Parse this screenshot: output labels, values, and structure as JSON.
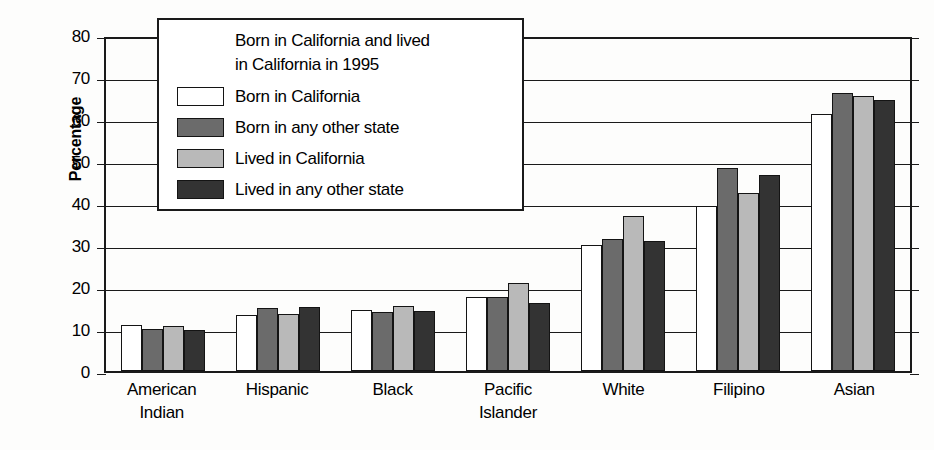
{
  "chart_data": {
    "type": "bar",
    "title": "",
    "xlabel": "",
    "ylabel": "Percentage",
    "ylim": [
      0,
      80
    ],
    "yticks": [
      0,
      10,
      20,
      30,
      40,
      50,
      60,
      70,
      80
    ],
    "grid": true,
    "legend_position": "upper-left-inside",
    "legend_title": [
      "Born in California and lived",
      "in California in 1995"
    ],
    "categories": [
      [
        "American",
        "Indian"
      ],
      [
        "Hispanic",
        ""
      ],
      [
        "Black",
        ""
      ],
      [
        "Pacific",
        "Islander"
      ],
      [
        "White",
        ""
      ],
      [
        "Filipino",
        ""
      ],
      [
        "Asian",
        ""
      ]
    ],
    "category_names": [
      "American Indian",
      "Hispanic",
      "Black",
      "Pacific Islander",
      "White",
      "Filipino",
      "Asian"
    ],
    "series": [
      {
        "name": "Born in California",
        "color": "#ffffff",
        "values": [
          11.0,
          13.4,
          14.5,
          17.6,
          30.0,
          39.3,
          61.3
        ]
      },
      {
        "name": "Born in any other state",
        "color": "#6b6b6b",
        "values": [
          10.1,
          14.9,
          14.1,
          17.7,
          31.4,
          48.4,
          66.2
        ]
      },
      {
        "name": "Lived in California",
        "color": "#b9b9b9",
        "values": [
          10.8,
          13.6,
          15.4,
          21.0,
          36.9,
          42.5,
          65.4
        ]
      },
      {
        "name": "Lived in any other state",
        "color": "#333333",
        "values": [
          9.7,
          15.2,
          14.4,
          16.3,
          31.0,
          46.7,
          64.6
        ]
      }
    ]
  },
  "axis": {
    "y_title": "Percentage",
    "tick_0": "0",
    "tick_10": "10",
    "tick_20": "20",
    "tick_30": "30",
    "tick_40": "40",
    "tick_50": "50",
    "tick_60": "60",
    "tick_70": "70",
    "tick_80": "80"
  },
  "legend": {
    "title_line1": "Born in California and lived",
    "title_line2": "in California in 1995",
    "items": [
      {
        "label": "Born in California",
        "swatch": "white-swatch"
      },
      {
        "label": "Born in any other state",
        "swatch": "dark-gray-swatch"
      },
      {
        "label": "Lived in California",
        "swatch": "light-gray-swatch"
      },
      {
        "label": "Lived in any other state",
        "swatch": "black-swatch"
      }
    ]
  },
  "x_labels": [
    {
      "line1": "American",
      "line2": "Indian"
    },
    {
      "line1": "Hispanic",
      "line2": ""
    },
    {
      "line1": "Black",
      "line2": ""
    },
    {
      "line1": "Pacific",
      "line2": "Islander"
    },
    {
      "line1": "White",
      "line2": ""
    },
    {
      "line1": "Filipino",
      "line2": ""
    },
    {
      "line1": "Asian",
      "line2": ""
    }
  ]
}
